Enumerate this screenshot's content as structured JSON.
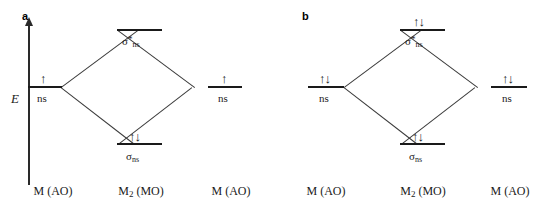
{
  "figure": {
    "type": "molecular-orbital-energy-diagram",
    "width": 543,
    "height": 211,
    "background": "#ffffff",
    "ink_color": "#1a1a1a"
  },
  "axis": {
    "label": "E",
    "meaning": "energy-increasing-upward",
    "arrow": "up"
  },
  "panels": [
    {
      "id": "a",
      "label": "a",
      "columns": [
        {
          "name": "left-ao",
          "caption_main": "M",
          "caption_sub": "",
          "caption_tail": " (AO)"
        },
        {
          "name": "center-mo",
          "caption_main": "M",
          "caption_sub": "2",
          "caption_tail": " (MO)"
        },
        {
          "name": "right-ao",
          "caption_main": "M",
          "caption_sub": "",
          "caption_tail": " (AO)"
        }
      ],
      "levels": [
        {
          "name": "antibonding",
          "orbital_main": "σ",
          "orbital_sup": "*",
          "orbital_sub": "ns",
          "electrons": "",
          "electron_count": 0,
          "occupancy": "empty"
        },
        {
          "name": "left-atomic",
          "orbital_main": "",
          "orbital_sup": "",
          "orbital_sub": "",
          "sub_caption": "ns",
          "electrons": "↑",
          "electron_count": 1,
          "occupancy": "half-filled"
        },
        {
          "name": "right-atomic",
          "orbital_main": "",
          "orbital_sup": "",
          "orbital_sub": "",
          "sub_caption": "ns",
          "electrons": "↑",
          "electron_count": 1,
          "occupancy": "half-filled"
        },
        {
          "name": "bonding",
          "orbital_main": "σ",
          "orbital_sup": "",
          "orbital_sub": "ns",
          "electrons": "↑↓",
          "electron_count": 2,
          "occupancy": "filled"
        }
      ],
      "total_electrons": 2,
      "bond_order": 1
    },
    {
      "id": "b",
      "label": "b",
      "columns": [
        {
          "name": "left-ao",
          "caption_main": "M",
          "caption_sub": "",
          "caption_tail": " (AO)"
        },
        {
          "name": "center-mo",
          "caption_main": "M",
          "caption_sub": "2",
          "caption_tail": " (MO)"
        },
        {
          "name": "right-ao",
          "caption_main": "M",
          "caption_sub": "",
          "caption_tail": " (AO)"
        }
      ],
      "levels": [
        {
          "name": "antibonding",
          "orbital_main": "σ",
          "orbital_sup": "*",
          "orbital_sub": "ns",
          "electrons": "↑↓",
          "electron_count": 2,
          "occupancy": "filled"
        },
        {
          "name": "left-atomic",
          "orbital_main": "",
          "orbital_sup": "",
          "orbital_sub": "",
          "sub_caption": "ns",
          "electrons": "↑↓",
          "electron_count": 2,
          "occupancy": "filled"
        },
        {
          "name": "right-atomic",
          "orbital_main": "",
          "orbital_sup": "",
          "orbital_sub": "",
          "sub_caption": "ns",
          "electrons": "↑↓",
          "electron_count": 2,
          "occupancy": "filled"
        },
        {
          "name": "bonding",
          "orbital_main": "σ",
          "orbital_sup": "",
          "orbital_sub": "ns",
          "electrons": "↑↓",
          "electron_count": 2,
          "occupancy": "filled"
        }
      ],
      "total_electrons": 4,
      "bond_order": 0
    }
  ]
}
